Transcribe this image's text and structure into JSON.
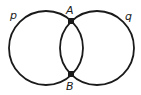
{
  "diagram": {
    "circles": [
      {
        "name": "p",
        "cx": 46,
        "cy": 48,
        "r": 37
      },
      {
        "name": "q",
        "cx": 97,
        "cy": 48,
        "r": 37
      }
    ],
    "points": [
      {
        "name": "A",
        "x": 71,
        "y": 21
      },
      {
        "name": "B",
        "x": 71,
        "y": 74
      }
    ],
    "labels": {
      "p": "p",
      "q": "q",
      "A": "A",
      "B": "B"
    },
    "colors": {
      "stroke": "#1a1a1a",
      "background": "#ffffff"
    }
  }
}
